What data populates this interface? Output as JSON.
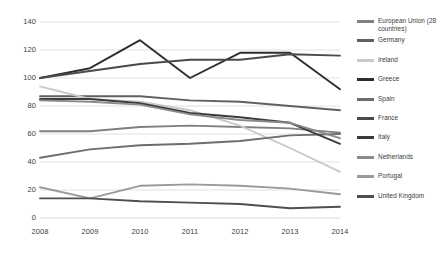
{
  "chart_data": {
    "type": "line",
    "title": "",
    "subtitle": "",
    "xlabel": "",
    "ylabel": "",
    "x": [
      "2008",
      "2009",
      "2010",
      "2011",
      "2012",
      "2013",
      "2014"
    ],
    "categories": [
      "2008",
      "2009",
      "2010",
      "2011",
      "2012",
      "2013",
      "2014"
    ],
    "ylim": [
      0,
      140
    ],
    "yticks": [
      0,
      20,
      40,
      60,
      80,
      100,
      120,
      140
    ],
    "ytick_labels": [
      "0",
      "20",
      "40",
      "60",
      "80",
      "100",
      "120",
      "140"
    ],
    "grid": "horizontal",
    "legend_position": "right",
    "series": [
      {
        "name": "European Union (28 countries)",
        "color": "#808080",
        "values": [
          62,
          62,
          65,
          66,
          65,
          64,
          61
        ]
      },
      {
        "name": "Germany",
        "color": "#606060",
        "values": [
          87,
          87,
          87,
          84,
          83,
          80,
          77
        ]
      },
      {
        "name": "Ireland",
        "color": "#c9c9c9",
        "values": [
          94,
          85,
          83,
          77,
          66,
          50,
          33
        ]
      },
      {
        "name": "Greece",
        "color": "#2e2e2e",
        "values": [
          100,
          107,
          127,
          100,
          118,
          118,
          92
        ]
      },
      {
        "name": "Spain",
        "color": "#6e6e6e",
        "values": [
          43,
          49,
          52,
          53,
          55,
          59,
          60
        ]
      },
      {
        "name": "France",
        "color": "#4a4a4a",
        "values": [
          100,
          105,
          110,
          113,
          113,
          117,
          116
        ]
      },
      {
        "name": "Italy",
        "color": "#3b3b3b",
        "values": [
          85,
          85,
          82,
          75,
          72,
          68,
          53
        ]
      },
      {
        "name": "Netherlands",
        "color": "#8a8a8a",
        "values": [
          84,
          83,
          81,
          74,
          70,
          68,
          57
        ]
      },
      {
        "name": "Portugal",
        "color": "#9a9a9a",
        "values": [
          22,
          14,
          23,
          24,
          23,
          21,
          17
        ]
      },
      {
        "name": "United Kingdom",
        "color": "#4f4f4f",
        "values": [
          14,
          14,
          12,
          11,
          10,
          7,
          8
        ]
      }
    ]
  },
  "legend": {
    "items": [
      {
        "label": "European Union (28 countries)"
      },
      {
        "label": "Germany"
      },
      {
        "label": "Ireland"
      },
      {
        "label": "Greece"
      },
      {
        "label": "Spain"
      },
      {
        "label": "France"
      },
      {
        "label": "Italy"
      },
      {
        "label": "Netherlands"
      },
      {
        "label": "Portugal"
      },
      {
        "label": "United Kingdom"
      }
    ]
  },
  "style": {
    "grid_color": "#d9d9d9",
    "axis_text_color": "#3d3d3d",
    "background": "#ffffff"
  }
}
